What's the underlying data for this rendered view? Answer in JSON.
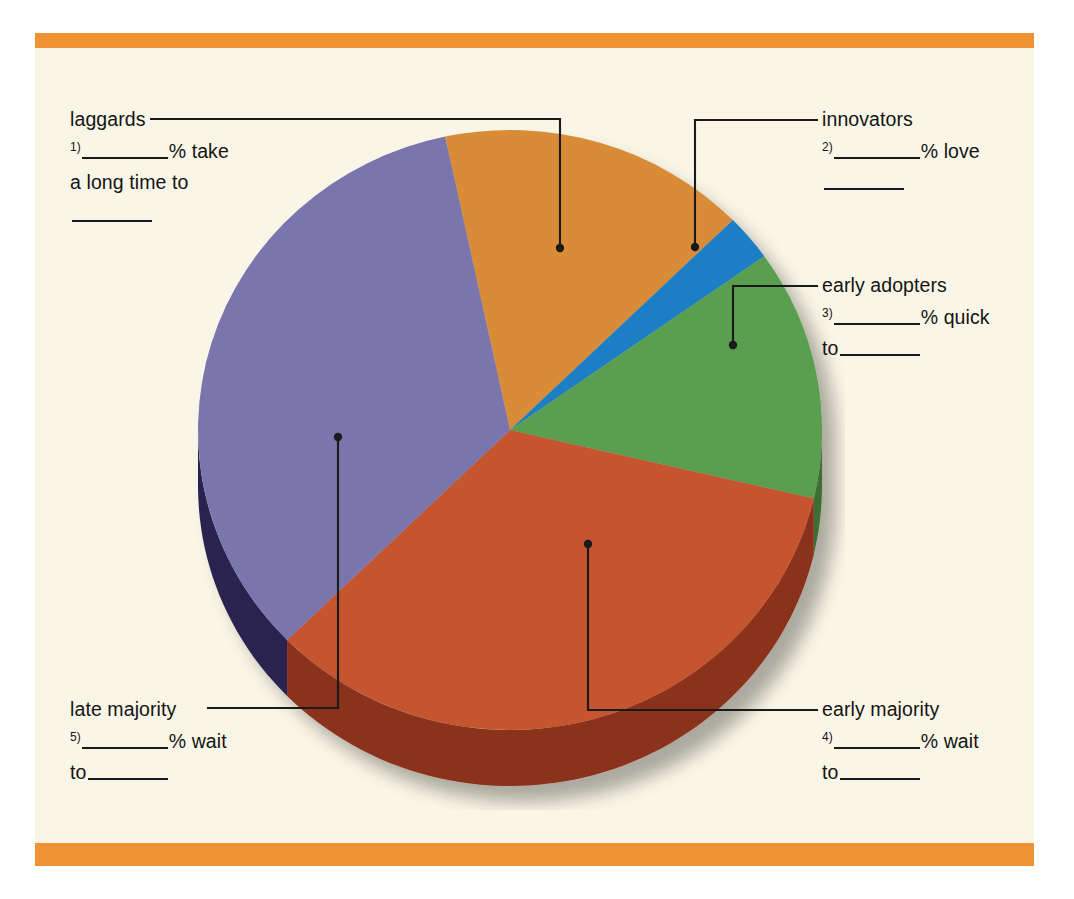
{
  "page": {
    "background_color": "#ffffff",
    "panel_color": "#faf6e7",
    "rule_color": "#ef9233"
  },
  "callouts": {
    "laggards": {
      "title": "laggards",
      "number": "1)",
      "line1_after_blank": "% take",
      "line2": "a long time to",
      "line3_trailing_blank": true
    },
    "innovators": {
      "title": "innovators",
      "number": "2)",
      "line1_after_blank": "% love",
      "line2": "",
      "line3_trailing_blank": true
    },
    "early_adopters": {
      "title": "early adopters",
      "number": "3)",
      "line1_after_blank": "% quick",
      "line2_prefix": "to"
    },
    "early_majority": {
      "title": "early majority",
      "number": "4)",
      "line1_after_blank": "% wait",
      "line2_prefix": "to"
    },
    "late_majority": {
      "title": "late majority",
      "number": "5)",
      "line1_after_blank": "% wait",
      "line2_prefix": "to"
    }
  },
  "chart_data": {
    "type": "pie",
    "title": "",
    "subtitle": "",
    "xlabel": "",
    "ylabel": "",
    "legend_position": "callouts",
    "grid": false,
    "note": "Diffusion of innovation adopter categories pie chart, 3D extruded. Percentage values are blanks for the student to fill in.",
    "categories": [
      "innovators",
      "early adopters",
      "early majority",
      "late majority",
      "laggards"
    ],
    "values": [
      2.5,
      13.5,
      34,
      34,
      16
    ],
    "labels": [
      "innovators",
      "early adopters",
      "early majority",
      "late majority",
      "laggards"
    ],
    "colors": [
      "#1f7ec4",
      "#5a9e4f",
      "#c4552e",
      "#7a75ad",
      "#d98c38"
    ],
    "side_colors": [
      "#15578a",
      "#3d6e36",
      "#8a331c",
      "#2a2450",
      "#9a6020"
    ],
    "start_angle_deg": -12,
    "slice_angles_deg": {
      "laggards": 57.6,
      "innovators": 9,
      "early_adopters": 48.6,
      "early_majority": 122.4,
      "late_majority": 122.4
    }
  }
}
